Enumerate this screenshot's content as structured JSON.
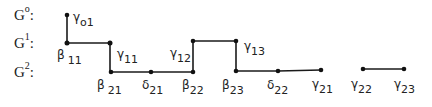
{
  "rows": [
    {
      "id": "G0",
      "base": "G",
      "sup": "o",
      "colon": ":",
      "y": 15
    },
    {
      "id": "G1",
      "base": "G",
      "sup": "1",
      "colon": ":",
      "y": 43
    },
    {
      "id": "G2",
      "base": "G",
      "sup": "2",
      "colon": ":",
      "y": 72
    }
  ],
  "nodes": [
    {
      "id": "gamma01",
      "greek": "γ",
      "sub": "o1",
      "x": 67,
      "y": 15
    },
    {
      "id": "beta11",
      "greek": "β",
      "sub": "11",
      "x": 67,
      "y": 43
    },
    {
      "id": "gamma11",
      "greek": "γ",
      "sub": "11",
      "x": 110,
      "y": 43
    },
    {
      "id": "beta21",
      "greek": "β",
      "sub": "21",
      "x": 111,
      "y": 72
    },
    {
      "id": "delta21",
      "greek": "δ",
      "sub": "21",
      "x": 151,
      "y": 72
    },
    {
      "id": "beta22",
      "greek": "β",
      "sub": "22",
      "x": 193,
      "y": 72
    },
    {
      "id": "gamma12",
      "greek": "γ",
      "sub": "12",
      "x": 193,
      "y": 41
    },
    {
      "id": "gamma13",
      "greek": "γ",
      "sub": "13",
      "x": 236,
      "y": 41
    },
    {
      "id": "beta23",
      "greek": "β",
      "sub": "23",
      "x": 236,
      "y": 71
    },
    {
      "id": "delta22",
      "greek": "δ",
      "sub": "22",
      "x": 278,
      "y": 71
    },
    {
      "id": "gamma21",
      "greek": "γ",
      "sub": "21",
      "x": 321,
      "y": 70
    },
    {
      "id": "gamma22",
      "greek": "γ",
      "sub": "22",
      "x": 363,
      "y": 69
    },
    {
      "id": "gamma23",
      "greek": "γ",
      "sub": "23",
      "x": 404,
      "y": 69
    }
  ],
  "edges": [
    [
      "gamma01",
      "beta11"
    ],
    [
      "beta11",
      "gamma11"
    ],
    [
      "gamma11",
      "beta21"
    ],
    [
      "beta21",
      "delta21"
    ],
    [
      "delta21",
      "beta22"
    ],
    [
      "beta22",
      "gamma12"
    ],
    [
      "gamma12",
      "gamma13"
    ],
    [
      "gamma13",
      "beta23"
    ],
    [
      "beta23",
      "delta22"
    ],
    [
      "delta22",
      "gamma21"
    ],
    [
      "gamma22",
      "gamma23"
    ]
  ],
  "labels": {
    "G0": {
      "base": "G",
      "sup": "o",
      "colon": ":"
    },
    "G1": {
      "base": "G",
      "sup": "1",
      "colon": ":"
    },
    "G2": {
      "base": "G",
      "sup": "2",
      "colon": ":"
    },
    "gamma01": {
      "greek": "γ",
      "sub": "o1"
    },
    "beta11": {
      "greek": "β",
      "sub": "11"
    },
    "gamma11": {
      "greek": "γ",
      "sub": "11"
    },
    "beta21": {
      "greek": "β",
      "sub": "21"
    },
    "delta21": {
      "greek": "δ",
      "sub": "21"
    },
    "beta22": {
      "greek": "β",
      "sub": "22"
    },
    "gamma12": {
      "greek": "γ",
      "sub": "12"
    },
    "gamma13": {
      "greek": "γ",
      "sub": "13"
    },
    "beta23": {
      "greek": "β",
      "sub": "23"
    },
    "delta22": {
      "greek": "δ",
      "sub": "22"
    },
    "gamma21": {
      "greek": "γ",
      "sub": "21"
    },
    "gamma22": {
      "greek": "γ",
      "sub": "22"
    },
    "gamma23": {
      "greek": "γ",
      "sub": "23"
    }
  },
  "colors": {
    "line": "#1a1a1a",
    "node": "#111111",
    "text": "#222222"
  }
}
